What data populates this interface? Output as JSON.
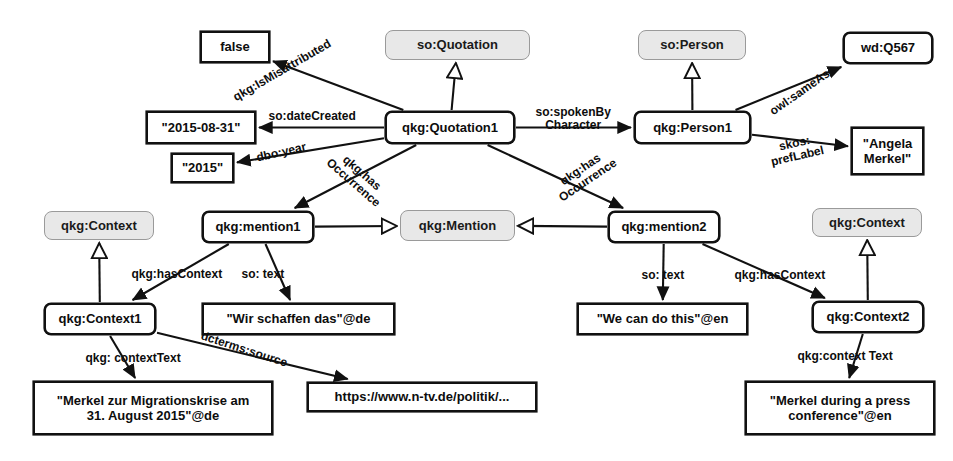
{
  "diagram": {
    "colors": {
      "node_border": "#111111",
      "class_fill": "#e8e8e8",
      "class_border": "#9a9a9a",
      "edge": "#111111",
      "background": "#ffffff"
    },
    "nodes": [
      {
        "id": "false",
        "label": "false",
        "kind": "literal",
        "x": 200,
        "y": 31,
        "w": 70,
        "h": 32
      },
      {
        "id": "soQuotation",
        "label": "so:Quotation",
        "kind": "class",
        "x": 385,
        "y": 30,
        "w": 145,
        "h": 30
      },
      {
        "id": "soPerson",
        "label": "so:Person",
        "kind": "class",
        "x": 638,
        "y": 30,
        "w": 108,
        "h": 30
      },
      {
        "id": "wdQ567",
        "label": "wd:Q567",
        "kind": "resource",
        "x": 843,
        "y": 32,
        "w": 90,
        "h": 32
      },
      {
        "id": "date",
        "label": "\"2015-08-31\"",
        "kind": "literal",
        "x": 146,
        "y": 111,
        "w": 110,
        "h": 33
      },
      {
        "id": "quotation1",
        "label": "qkg:Quotation1",
        "kind": "resource",
        "x": 385,
        "y": 111,
        "w": 130,
        "h": 33
      },
      {
        "id": "person1",
        "label": "qkg:Person1",
        "kind": "resource",
        "x": 634,
        "y": 111,
        "w": 117,
        "h": 33
      },
      {
        "id": "angela",
        "label": "\"Angela\nMerkel\"",
        "kind": "literal",
        "x": 851,
        "y": 127,
        "w": 73,
        "h": 48
      },
      {
        "id": "year",
        "label": "\"2015\"",
        "kind": "literal",
        "x": 171,
        "y": 153,
        "w": 63,
        "h": 30
      },
      {
        "id": "ctxClass1",
        "label": "qkg:Context",
        "kind": "class",
        "x": 44,
        "y": 211,
        "w": 110,
        "h": 29
      },
      {
        "id": "mention1",
        "label": "qkg:mention1",
        "kind": "resource",
        "x": 202,
        "y": 211,
        "w": 112,
        "h": 32
      },
      {
        "id": "mentionClass",
        "label": "qkg:Mention",
        "kind": "class",
        "x": 400,
        "y": 210,
        "w": 115,
        "h": 31
      },
      {
        "id": "mention2",
        "label": "qkg:mention2",
        "kind": "resource",
        "x": 608,
        "y": 211,
        "w": 112,
        "h": 32
      },
      {
        "id": "ctxClass2",
        "label": "qkg:Context",
        "kind": "class",
        "x": 812,
        "y": 208,
        "w": 110,
        "h": 29
      },
      {
        "id": "context1",
        "label": "qkg:Context1",
        "kind": "resource",
        "x": 44,
        "y": 303,
        "w": 112,
        "h": 32
      },
      {
        "id": "wirSchaffen",
        "label": "\"Wir schaffen das\"@de",
        "kind": "literal",
        "x": 202,
        "y": 303,
        "w": 193,
        "h": 32
      },
      {
        "id": "weCanDo",
        "label": "\"We can do this\"@en",
        "kind": "literal",
        "x": 577,
        "y": 303,
        "w": 171,
        "h": 32
      },
      {
        "id": "context2",
        "label": "qkg:Context2",
        "kind": "resource",
        "x": 812,
        "y": 301,
        "w": 112,
        "h": 32
      },
      {
        "id": "merkelDe",
        "label": "\"Merkel zur Migrationskrise am\n31. August 2015\"@de",
        "kind": "literal",
        "x": 33,
        "y": 381,
        "w": 240,
        "h": 54
      },
      {
        "id": "ntvUrl",
        "label": "https://www.n-tv.de/politik/...",
        "kind": "literal",
        "x": 307,
        "y": 382,
        "w": 230,
        "h": 30
      },
      {
        "id": "merkelEn",
        "label": "\"Merkel during a press\nconference\"@en",
        "kind": "literal",
        "x": 745,
        "y": 381,
        "w": 190,
        "h": 54
      }
    ],
    "edges": [
      {
        "id": "isMisattributed",
        "from": "quotation1",
        "to": "false",
        "predicate": "qkg:IsMisattributed",
        "arrow": "filled"
      },
      {
        "id": "typeQuotation",
        "from": "quotation1",
        "to": "soQuotation",
        "predicate": "",
        "arrow": "hollow"
      },
      {
        "id": "dateCreated",
        "from": "quotation1",
        "to": "date",
        "predicate": "so:dateCreated",
        "arrow": "filled"
      },
      {
        "id": "dboYear",
        "from": "quotation1",
        "to": "year",
        "predicate": "dbo:year",
        "arrow": "filled"
      },
      {
        "id": "spokenBy",
        "from": "quotation1",
        "to": "person1",
        "predicate": "so:spokenBy\nCharacter",
        "arrow": "filled"
      },
      {
        "id": "hasOccurrence1",
        "from": "quotation1",
        "to": "mention1",
        "predicate": "qkg:has\nOccurrence",
        "arrow": "filled"
      },
      {
        "id": "hasOccurrence2",
        "from": "quotation1",
        "to": "mention2",
        "predicate": "qkg:has\nOccurrence",
        "arrow": "filled"
      },
      {
        "id": "typePerson",
        "from": "person1",
        "to": "soPerson",
        "predicate": "",
        "arrow": "hollow"
      },
      {
        "id": "sameAs",
        "from": "person1",
        "to": "wdQ567",
        "predicate": "owl:sameAs",
        "arrow": "filled"
      },
      {
        "id": "prefLabel",
        "from": "person1",
        "to": "angela",
        "predicate": "skos:\nprefLabel",
        "arrow": "filled"
      },
      {
        "id": "typeMention1",
        "from": "mention1",
        "to": "mentionClass",
        "predicate": "",
        "arrow": "hollow"
      },
      {
        "id": "typeMention2",
        "from": "mention2",
        "to": "mentionClass",
        "predicate": "",
        "arrow": "hollow"
      },
      {
        "id": "hasContext1",
        "from": "mention1",
        "to": "context1",
        "predicate": "qkg:hasContext",
        "arrow": "filled"
      },
      {
        "id": "soText1",
        "from": "mention1",
        "to": "wirSchaffen",
        "predicate": "so: text",
        "arrow": "filled"
      },
      {
        "id": "soText2",
        "from": "mention2",
        "to": "weCanDo",
        "predicate": "so: text",
        "arrow": "filled"
      },
      {
        "id": "hasContext2",
        "from": "mention2",
        "to": "context2",
        "predicate": "qkg:hasContext",
        "arrow": "filled"
      },
      {
        "id": "typeContext1",
        "from": "context1",
        "to": "ctxClass1",
        "predicate": "",
        "arrow": "hollow"
      },
      {
        "id": "typeContext2",
        "from": "context2",
        "to": "ctxClass2",
        "predicate": "",
        "arrow": "hollow"
      },
      {
        "id": "contextText1",
        "from": "context1",
        "to": "merkelDe",
        "predicate": "qkg: contextText",
        "arrow": "filled"
      },
      {
        "id": "dctermsSource",
        "from": "context1",
        "to": "ntvUrl",
        "predicate": "dcterms:source",
        "arrow": "filled"
      },
      {
        "id": "contextText2",
        "from": "context2",
        "to": "merkelEn",
        "predicate": "qkg:context Text",
        "arrow": "filled"
      }
    ],
    "edge_labels": [
      {
        "id": "lbl-isMisattributed",
        "text": "qkg:IsMisattributed",
        "x": 282,
        "y": 70,
        "rotate": -30,
        "align": "center"
      },
      {
        "id": "lbl-dateCreated",
        "text": "so:dateCreated",
        "x": 312,
        "y": 116,
        "rotate": 0,
        "align": "center"
      },
      {
        "id": "lbl-dboYear",
        "text": "dbo:year",
        "x": 281,
        "y": 152,
        "rotate": -13,
        "align": "center"
      },
      {
        "id": "lbl-spokenBy",
        "text": "so:spokenBy\nCharacter",
        "x": 573,
        "y": 119,
        "rotate": 0,
        "align": "center"
      },
      {
        "id": "lbl-hasOcc1",
        "text": "qkg:has\nOccurrence",
        "x": 357,
        "y": 178,
        "rotate": 41,
        "align": "center"
      },
      {
        "id": "lbl-hasOcc2",
        "text": "qkg:has\nOccurrence",
        "x": 584,
        "y": 175,
        "rotate": -34,
        "align": "center"
      },
      {
        "id": "lbl-sameAs",
        "text": "owl:sameAs",
        "x": 800,
        "y": 92,
        "rotate": -35,
        "align": "center"
      },
      {
        "id": "lbl-prefLabel",
        "text": "skos:\nprefLabel",
        "x": 796,
        "y": 150,
        "rotate": -13,
        "align": "center"
      },
      {
        "id": "lbl-hasContext1",
        "text": "qkg:hasContext",
        "x": 177,
        "y": 274,
        "rotate": 0,
        "align": "center"
      },
      {
        "id": "lbl-soText1",
        "text": "so: text",
        "x": 263,
        "y": 274,
        "rotate": 0,
        "align": "center"
      },
      {
        "id": "lbl-soText2",
        "text": "so: text",
        "x": 663,
        "y": 275,
        "rotate": 0,
        "align": "center"
      },
      {
        "id": "lbl-hasContext2",
        "text": "qkg:hasContext",
        "x": 780,
        "y": 275,
        "rotate": 0,
        "align": "center"
      },
      {
        "id": "lbl-contextText1",
        "text": "qkg: contextText",
        "x": 133,
        "y": 358,
        "rotate": 0,
        "align": "center"
      },
      {
        "id": "lbl-dctermsSource",
        "text": "dcterms:source",
        "x": 244,
        "y": 349,
        "rotate": 18,
        "align": "center"
      },
      {
        "id": "lbl-contextText2",
        "text": "qkg:context Text",
        "x": 845,
        "y": 356,
        "rotate": 0,
        "align": "center"
      }
    ]
  }
}
